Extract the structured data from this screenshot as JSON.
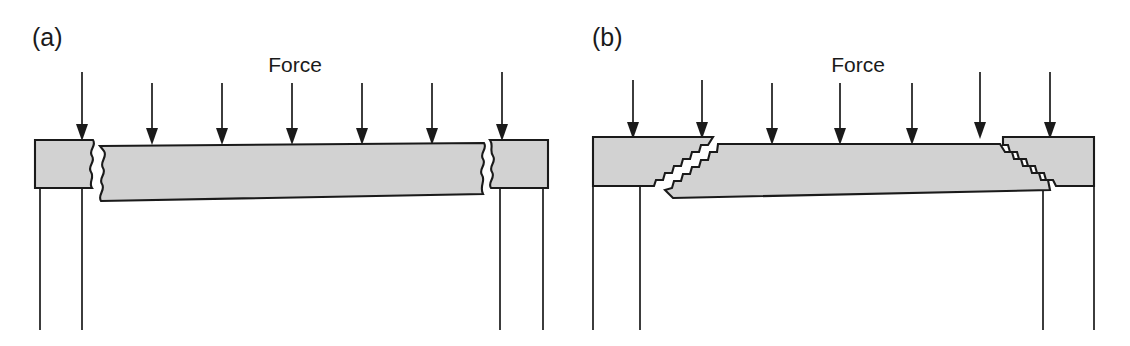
{
  "figure": {
    "width": 1130,
    "height": 346,
    "background_color": "#ffffff",
    "line_color": "#1a1a1a",
    "block_fill_color": "#d2d2d2"
  },
  "panels": [
    {
      "id": "a",
      "label": "(a)",
      "label_x": 32,
      "label_y": 46,
      "force_label": "Force",
      "force_label_x": 295,
      "force_label_y": 72,
      "fracture_style": "vertical-wavy",
      "arrow_count": 7,
      "arrows": [
        {
          "x": 82,
          "y_top": 72,
          "y_tip": 139
        },
        {
          "x": 152,
          "y_top": 83,
          "y_tip": 143
        },
        {
          "x": 222,
          "y_top": 83,
          "y_tip": 143
        },
        {
          "x": 292,
          "y_top": 83,
          "y_tip": 143
        },
        {
          "x": 362,
          "y_top": 83,
          "y_tip": 143
        },
        {
          "x": 432,
          "y_top": 83,
          "y_tip": 143
        },
        {
          "x": 502,
          "y_top": 72,
          "y_tip": 139
        }
      ],
      "left_block": {
        "x_left": 35,
        "x_right": 98,
        "y_top": 140,
        "y_bottom": 188
      },
      "right_block": {
        "x_left": 488,
        "x_right": 548,
        "y_top": 140,
        "y_bottom": 188
      },
      "center_block": {
        "x_left": 96,
        "x_right": 490,
        "y_top_left": 146,
        "y_top_right": 143,
        "y_bottom_left": 201,
        "y_bottom_right": 194
      },
      "supports": [
        {
          "x": 40,
          "y_top": 188,
          "y_bottom": 330
        },
        {
          "x": 82,
          "y_top": 188,
          "y_bottom": 330
        },
        {
          "x": 500,
          "y_top": 188,
          "y_bottom": 330
        },
        {
          "x": 543,
          "y_top": 188,
          "y_bottom": 330
        }
      ]
    },
    {
      "id": "b",
      "label": "(b)",
      "label_x": 592,
      "label_y": 46,
      "force_label": "Force",
      "force_label_x": 858,
      "force_label_y": 72,
      "fracture_style": "inclined-stepped",
      "arrow_count": 7,
      "arrows": [
        {
          "x": 633,
          "y_top": 80,
          "y_tip": 137
        },
        {
          "x": 702,
          "y_top": 80,
          "y_tip": 137
        },
        {
          "x": 772,
          "y_top": 83,
          "y_tip": 143
        },
        {
          "x": 840,
          "y_top": 83,
          "y_tip": 143
        },
        {
          "x": 912,
          "y_top": 83,
          "y_tip": 143
        },
        {
          "x": 980,
          "y_top": 72,
          "y_tip": 137
        },
        {
          "x": 1050,
          "y_top": 72,
          "y_tip": 137
        }
      ],
      "left_block": {
        "x_left": 593,
        "x_right": 715,
        "y_top": 137,
        "y_bottom": 186
      },
      "right_block": {
        "x_left": 1000,
        "x_right": 1094,
        "y_top": 137,
        "y_bottom": 186
      },
      "center_block": {
        "x_top_left": 713,
        "x_top_right": 1003,
        "x_bottom_left": 670,
        "x_bottom_right": 1043,
        "y_top": 144,
        "y_bottom": 198
      },
      "supports": [
        {
          "x": 593,
          "y_top": 186,
          "y_bottom": 330
        },
        {
          "x": 640,
          "y_top": 186,
          "y_bottom": 330
        },
        {
          "x": 1043,
          "y_top": 186,
          "y_bottom": 330
        },
        {
          "x": 1094,
          "y_top": 186,
          "y_bottom": 330
        }
      ]
    }
  ]
}
